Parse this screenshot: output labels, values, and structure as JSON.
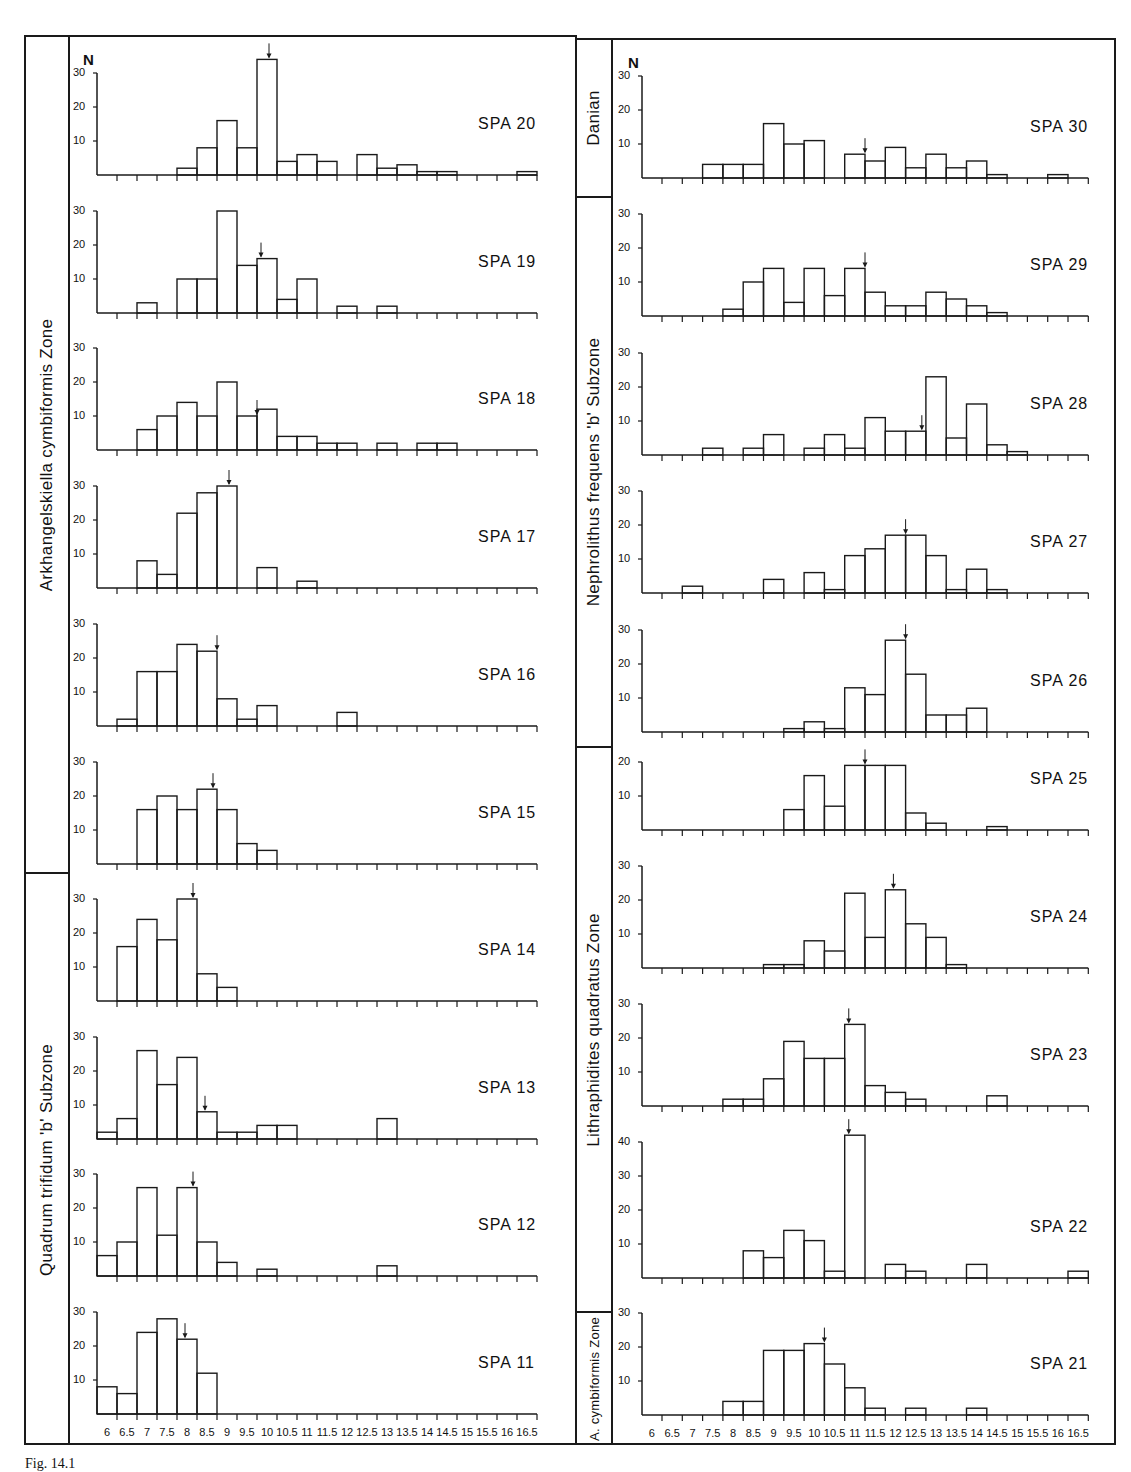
{
  "figure": {
    "axis_label": "N",
    "caption": "Fig. 14.1",
    "x_ticks": [
      "6",
      "6.5",
      "7",
      "7.5",
      "8",
      "8.5",
      "9",
      "9.5",
      "10",
      "10.5",
      "11",
      "11.5",
      "12",
      "12.5",
      "13",
      "13.5",
      "14",
      "14.5",
      "15",
      "15.5",
      "16",
      "16.5"
    ],
    "left_zones": [
      {
        "label": "Arkhangelskiella cymbiformis Zone",
        "samples": [
          "SPA 20",
          "SPA 19",
          "SPA 18",
          "SPA 17",
          "SPA 16",
          "SPA 15"
        ]
      },
      {
        "label": "Quadrum trifidum 'b' Subzone",
        "samples": [
          "SPA 14",
          "SPA 13",
          "SPA 12",
          "SPA 11"
        ]
      }
    ],
    "right_zones": [
      {
        "label": "Danian",
        "samples": [
          "SPA 30"
        ]
      },
      {
        "label": "Nephrolithus frequens 'b' Subzone",
        "samples": [
          "SPA 29",
          "SPA 28",
          "SPA 27",
          "SPA 26"
        ]
      },
      {
        "label": "Lithraphidites quadratus Zone",
        "samples": [
          "SPA 25",
          "SPA 24",
          "SPA 23",
          "SPA 22"
        ]
      },
      {
        "label": "A. cymbiformis Zone",
        "samples": [
          "SPA 21"
        ]
      }
    ]
  },
  "chart_data": [
    {
      "type": "bar",
      "title": "SPA 20",
      "zone": "Arkhangelskiella cymbiformis Zone",
      "ylabel": "N",
      "ylim": [
        0,
        30
      ],
      "yticks": [
        10,
        20,
        30
      ],
      "categories": [
        "6",
        "6.5",
        "7",
        "7.5",
        "8",
        "8.5",
        "9",
        "9.5",
        "10",
        "10.5",
        "11",
        "11.5",
        "12",
        "12.5",
        "13",
        "13.5",
        "14",
        "14.5",
        "15",
        "15.5",
        "16",
        "16.5"
      ],
      "values": [
        0,
        0,
        0,
        0,
        2,
        8,
        16,
        8,
        34,
        4,
        6,
        4,
        0,
        6,
        2,
        3,
        1,
        1,
        0,
        0,
        0,
        1
      ],
      "mean_arrow_x": 9.8
    },
    {
      "type": "bar",
      "title": "SPA 19",
      "zone": "Arkhangelskiella cymbiformis Zone",
      "ylabel": "N",
      "ylim": [
        0,
        30
      ],
      "yticks": [
        10,
        20,
        30
      ],
      "categories": [
        "6",
        "6.5",
        "7",
        "7.5",
        "8",
        "8.5",
        "9",
        "9.5",
        "10",
        "10.5",
        "11",
        "11.5",
        "12",
        "12.5",
        "13",
        "13.5",
        "14",
        "14.5",
        "15",
        "15.5",
        "16",
        "16.5"
      ],
      "values": [
        0,
        0,
        3,
        0,
        10,
        10,
        30,
        14,
        16,
        4,
        10,
        0,
        2,
        0,
        2,
        0,
        0,
        0,
        0,
        0,
        0,
        0
      ],
      "mean_arrow_x": 9.6
    },
    {
      "type": "bar",
      "title": "SPA 18",
      "zone": "Arkhangelskiella cymbiformis Zone",
      "ylabel": "N",
      "ylim": [
        0,
        30
      ],
      "yticks": [
        10,
        20,
        30
      ],
      "categories": [
        "6",
        "6.5",
        "7",
        "7.5",
        "8",
        "8.5",
        "9",
        "9.5",
        "10",
        "10.5",
        "11",
        "11.5",
        "12",
        "12.5",
        "13",
        "13.5",
        "14",
        "14.5",
        "15",
        "15.5",
        "16",
        "16.5"
      ],
      "values": [
        0,
        0,
        6,
        10,
        14,
        10,
        20,
        10,
        12,
        4,
        4,
        2,
        2,
        0,
        2,
        0,
        2,
        2,
        0,
        0,
        0,
        0
      ],
      "mean_arrow_x": 9.5
    },
    {
      "type": "bar",
      "title": "SPA 17",
      "zone": "Arkhangelskiella cymbiformis Zone",
      "ylabel": "N",
      "ylim": [
        0,
        30
      ],
      "yticks": [
        10,
        20,
        30
      ],
      "categories": [
        "6",
        "6.5",
        "7",
        "7.5",
        "8",
        "8.5",
        "9",
        "9.5",
        "10",
        "10.5",
        "11",
        "11.5",
        "12",
        "12.5",
        "13",
        "13.5",
        "14",
        "14.5",
        "15",
        "15.5",
        "16",
        "16.5"
      ],
      "values": [
        0,
        0,
        8,
        4,
        22,
        28,
        30,
        0,
        6,
        0,
        2,
        0,
        0,
        0,
        0,
        0,
        0,
        0,
        0,
        0,
        0,
        0
      ],
      "mean_arrow_x": 8.8
    },
    {
      "type": "bar",
      "title": "SPA 16",
      "zone": "Arkhangelskiella cymbiformis Zone",
      "ylabel": "N",
      "ylim": [
        0,
        30
      ],
      "yticks": [
        10,
        20,
        30
      ],
      "categories": [
        "6",
        "6.5",
        "7",
        "7.5",
        "8",
        "8.5",
        "9",
        "9.5",
        "10",
        "10.5",
        "11",
        "11.5",
        "12",
        "12.5",
        "13",
        "13.5",
        "14",
        "14.5",
        "15",
        "15.5",
        "16",
        "16.5"
      ],
      "values": [
        0,
        2,
        16,
        16,
        24,
        22,
        8,
        2,
        6,
        0,
        0,
        0,
        4,
        0,
        0,
        0,
        0,
        0,
        0,
        0,
        0,
        0
      ],
      "mean_arrow_x": 8.5
    },
    {
      "type": "bar",
      "title": "SPA 15",
      "zone": "Arkhangelskiella cymbiformis Zone",
      "ylabel": "N",
      "ylim": [
        0,
        30
      ],
      "yticks": [
        10,
        20,
        30
      ],
      "categories": [
        "6",
        "6.5",
        "7",
        "7.5",
        "8",
        "8.5",
        "9",
        "9.5",
        "10",
        "10.5",
        "11",
        "11.5",
        "12",
        "12.5",
        "13",
        "13.5",
        "14",
        "14.5",
        "15",
        "15.5",
        "16",
        "16.5"
      ],
      "values": [
        0,
        0,
        16,
        20,
        16,
        22,
        16,
        6,
        4,
        0,
        0,
        0,
        0,
        0,
        0,
        0,
        0,
        0,
        0,
        0,
        0,
        0
      ],
      "mean_arrow_x": 8.4
    },
    {
      "type": "bar",
      "title": "SPA 14",
      "zone": "Quadrum trifidum 'b' Subzone",
      "ylabel": "N",
      "ylim": [
        0,
        30
      ],
      "yticks": [
        10,
        20,
        30
      ],
      "categories": [
        "6",
        "6.5",
        "7",
        "7.5",
        "8",
        "8.5",
        "9",
        "9.5",
        "10",
        "10.5",
        "11",
        "11.5",
        "12",
        "12.5",
        "13",
        "13.5",
        "14",
        "14.5",
        "15",
        "15.5",
        "16",
        "16.5"
      ],
      "values": [
        0,
        16,
        24,
        18,
        30,
        8,
        4,
        0,
        0,
        0,
        0,
        0,
        0,
        0,
        0,
        0,
        0,
        0,
        0,
        0,
        0,
        0
      ],
      "mean_arrow_x": 7.9
    },
    {
      "type": "bar",
      "title": "SPA 13",
      "zone": "Quadrum trifidum 'b' Subzone",
      "ylabel": "N",
      "ylim": [
        0,
        30
      ],
      "yticks": [
        10,
        20,
        30
      ],
      "categories": [
        "6",
        "6.5",
        "7",
        "7.5",
        "8",
        "8.5",
        "9",
        "9.5",
        "10",
        "10.5",
        "11",
        "11.5",
        "12",
        "12.5",
        "13",
        "13.5",
        "14",
        "14.5",
        "15",
        "15.5",
        "16",
        "16.5"
      ],
      "values": [
        2,
        6,
        26,
        16,
        24,
        8,
        2,
        2,
        4,
        4,
        0,
        0,
        0,
        0,
        6,
        0,
        0,
        0,
        0,
        0,
        0,
        0
      ],
      "mean_arrow_x": 8.2
    },
    {
      "type": "bar",
      "title": "SPA 12",
      "zone": "Quadrum trifidum 'b' Subzone",
      "ylabel": "N",
      "ylim": [
        0,
        30
      ],
      "yticks": [
        10,
        20,
        30
      ],
      "categories": [
        "6",
        "6.5",
        "7",
        "7.5",
        "8",
        "8.5",
        "9",
        "9.5",
        "10",
        "10.5",
        "11",
        "11.5",
        "12",
        "12.5",
        "13",
        "13.5",
        "14",
        "14.5",
        "15",
        "15.5",
        "16",
        "16.5"
      ],
      "values": [
        6,
        10,
        26,
        12,
        26,
        10,
        4,
        0,
        2,
        0,
        0,
        0,
        0,
        0,
        3,
        0,
        0,
        0,
        0,
        0,
        0,
        0
      ],
      "mean_arrow_x": 7.9
    },
    {
      "type": "bar",
      "title": "SPA 11",
      "zone": "Quadrum trifidum 'b' Subzone",
      "ylabel": "N",
      "ylim": [
        0,
        30
      ],
      "yticks": [
        10,
        20,
        30
      ],
      "categories": [
        "6",
        "6.5",
        "7",
        "7.5",
        "8",
        "8.5",
        "9",
        "9.5",
        "10",
        "10.5",
        "11",
        "11.5",
        "12",
        "12.5",
        "13",
        "13.5",
        "14",
        "14.5",
        "15",
        "15.5",
        "16",
        "16.5"
      ],
      "values": [
        8,
        6,
        24,
        28,
        22,
        12,
        0,
        0,
        0,
        0,
        0,
        0,
        0,
        0,
        0,
        0,
        0,
        0,
        0,
        0,
        0,
        0
      ],
      "mean_arrow_x": 7.7
    },
    {
      "type": "bar",
      "title": "SPA 30",
      "zone": "Danian",
      "ylabel": "N",
      "ylim": [
        0,
        30
      ],
      "yticks": [
        10,
        20,
        30
      ],
      "categories": [
        "6",
        "6.5",
        "7",
        "7.5",
        "8",
        "8.5",
        "9",
        "9.5",
        "10",
        "10.5",
        "11",
        "11.5",
        "12",
        "12.5",
        "13",
        "13.5",
        "14",
        "14.5",
        "15",
        "15.5",
        "16",
        "16.5"
      ],
      "values": [
        0,
        0,
        0,
        4,
        4,
        4,
        16,
        10,
        11,
        0,
        7,
        5,
        9,
        3,
        7,
        3,
        5,
        1,
        0,
        0,
        1,
        0
      ],
      "mean_arrow_x": 11.0
    },
    {
      "type": "bar",
      "title": "SPA 29",
      "zone": "Nephrolithus frequens 'b' Subzone",
      "ylabel": "N",
      "ylim": [
        0,
        30
      ],
      "yticks": [
        10,
        20,
        30
      ],
      "categories": [
        "6",
        "6.5",
        "7",
        "7.5",
        "8",
        "8.5",
        "9",
        "9.5",
        "10",
        "10.5",
        "11",
        "11.5",
        "12",
        "12.5",
        "13",
        "13.5",
        "14",
        "14.5",
        "15",
        "15.5",
        "16",
        "16.5"
      ],
      "values": [
        0,
        0,
        0,
        0,
        2,
        10,
        14,
        4,
        14,
        6,
        14,
        7,
        3,
        3,
        7,
        5,
        3,
        1,
        0,
        0,
        0,
        0
      ],
      "mean_arrow_x": 11.0
    },
    {
      "type": "bar",
      "title": "SPA 28",
      "zone": "Nephrolithus frequens 'b' Subzone",
      "ylabel": "N",
      "ylim": [
        0,
        30
      ],
      "yticks": [
        10,
        20,
        30
      ],
      "categories": [
        "6",
        "6.5",
        "7",
        "7.5",
        "8",
        "8.5",
        "9",
        "9.5",
        "10",
        "10.5",
        "11",
        "11.5",
        "12",
        "12.5",
        "13",
        "13.5",
        "14",
        "14.5",
        "15",
        "15.5",
        "16",
        "16.5"
      ],
      "values": [
        0,
        0,
        0,
        2,
        0,
        2,
        6,
        0,
        2,
        6,
        2,
        11,
        7,
        7,
        23,
        5,
        15,
        3,
        1,
        0,
        0,
        0
      ],
      "mean_arrow_x": 12.4
    },
    {
      "type": "bar",
      "title": "SPA 27",
      "zone": "Nephrolithus frequens 'b' Subzone",
      "ylabel": "N",
      "ylim": [
        0,
        30
      ],
      "yticks": [
        10,
        20,
        30
      ],
      "categories": [
        "6",
        "6.5",
        "7",
        "7.5",
        "8",
        "8.5",
        "9",
        "9.5",
        "10",
        "10.5",
        "11",
        "11.5",
        "12",
        "12.5",
        "13",
        "13.5",
        "14",
        "14.5",
        "15",
        "15.5",
        "16",
        "16.5"
      ],
      "values": [
        0,
        0,
        2,
        0,
        0,
        0,
        4,
        0,
        6,
        1,
        11,
        13,
        17,
        17,
        11,
        1,
        7,
        1,
        0,
        0,
        0,
        0
      ],
      "mean_arrow_x": 12.0
    },
    {
      "type": "bar",
      "title": "SPA 26",
      "zone": "Nephrolithus frequens 'b' Subzone",
      "ylabel": "N",
      "ylim": [
        0,
        30
      ],
      "yticks": [
        10,
        20,
        30
      ],
      "categories": [
        "6",
        "6.5",
        "7",
        "7.5",
        "8",
        "8.5",
        "9",
        "9.5",
        "10",
        "10.5",
        "11",
        "11.5",
        "12",
        "12.5",
        "13",
        "13.5",
        "14",
        "14.5",
        "15",
        "15.5",
        "16",
        "16.5"
      ],
      "values": [
        0,
        0,
        0,
        0,
        0,
        0,
        0,
        1,
        3,
        1,
        13,
        11,
        27,
        17,
        5,
        5,
        7,
        0,
        0,
        0,
        0,
        0
      ],
      "mean_arrow_x": 12.0
    },
    {
      "type": "bar",
      "title": "SPA 25",
      "zone": "Lithraphidites quadratus Zone",
      "ylabel": "N",
      "ylim": [
        0,
        20
      ],
      "yticks": [
        10,
        20
      ],
      "categories": [
        "6",
        "6.5",
        "7",
        "7.5",
        "8",
        "8.5",
        "9",
        "9.5",
        "10",
        "10.5",
        "11",
        "11.5",
        "12",
        "12.5",
        "13",
        "13.5",
        "14",
        "14.5",
        "15",
        "15.5",
        "16",
        "16.5"
      ],
      "values": [
        0,
        0,
        0,
        0,
        0,
        0,
        0,
        6,
        16,
        7,
        19,
        19,
        19,
        5,
        2,
        0,
        0,
        1,
        0,
        0,
        0,
        0
      ],
      "mean_arrow_x": 11.0
    },
    {
      "type": "bar",
      "title": "SPA 24",
      "zone": "Lithraphidites quadratus Zone",
      "ylabel": "N",
      "ylim": [
        0,
        30
      ],
      "yticks": [
        10,
        20,
        30
      ],
      "categories": [
        "6",
        "6.5",
        "7",
        "7.5",
        "8",
        "8.5",
        "9",
        "9.5",
        "10",
        "10.5",
        "11",
        "11.5",
        "12",
        "12.5",
        "13",
        "13.5",
        "14",
        "14.5",
        "15",
        "15.5",
        "16",
        "16.5"
      ],
      "values": [
        0,
        0,
        0,
        0,
        0,
        0,
        1,
        1,
        8,
        5,
        22,
        9,
        23,
        13,
        9,
        1,
        0,
        0,
        0,
        0,
        0,
        0
      ],
      "mean_arrow_x": 11.7
    },
    {
      "type": "bar",
      "title": "SPA 23",
      "zone": "Lithraphidites quadratus Zone",
      "ylabel": "N",
      "ylim": [
        0,
        30
      ],
      "yticks": [
        10,
        20,
        30
      ],
      "categories": [
        "6",
        "6.5",
        "7",
        "7.5",
        "8",
        "8.5",
        "9",
        "9.5",
        "10",
        "10.5",
        "11",
        "11.5",
        "12",
        "12.5",
        "13",
        "13.5",
        "14",
        "14.5",
        "15",
        "15.5",
        "16",
        "16.5"
      ],
      "values": [
        0,
        0,
        0,
        0,
        2,
        2,
        8,
        19,
        14,
        14,
        24,
        6,
        4,
        2,
        0,
        0,
        0,
        3,
        0,
        0,
        0,
        0
      ],
      "mean_arrow_x": 10.6
    },
    {
      "type": "bar",
      "title": "SPA 22",
      "zone": "Lithraphidites quadratus Zone",
      "ylabel": "N",
      "ylim": [
        0,
        40
      ],
      "yticks": [
        10,
        20,
        30,
        40
      ],
      "categories": [
        "6",
        "6.5",
        "7",
        "7.5",
        "8",
        "8.5",
        "9",
        "9.5",
        "10",
        "10.5",
        "11",
        "11.5",
        "12",
        "12.5",
        "13",
        "13.5",
        "14",
        "14.5",
        "15",
        "15.5",
        "16",
        "16.5"
      ],
      "values": [
        0,
        0,
        0,
        0,
        0,
        8,
        6,
        14,
        11,
        2,
        42,
        0,
        4,
        2,
        0,
        0,
        4,
        0,
        0,
        0,
        0,
        2
      ],
      "mean_arrow_x": 10.6
    },
    {
      "type": "bar",
      "title": "SPA 21",
      "zone": "A. cymbiformis Zone",
      "ylabel": "N",
      "ylim": [
        0,
        30
      ],
      "yticks": [
        10,
        20,
        30
      ],
      "categories": [
        "6",
        "6.5",
        "7",
        "7.5",
        "8",
        "8.5",
        "9",
        "9.5",
        "10",
        "10.5",
        "11",
        "11.5",
        "12",
        "12.5",
        "13",
        "13.5",
        "14",
        "14.5",
        "15",
        "15.5",
        "16",
        "16.5"
      ],
      "values": [
        0,
        0,
        0,
        0,
        4,
        4,
        19,
        19,
        21,
        15,
        8,
        2,
        0,
        2,
        0,
        0,
        2,
        0,
        0,
        0,
        0,
        0
      ],
      "mean_arrow_x": 10.0
    }
  ]
}
